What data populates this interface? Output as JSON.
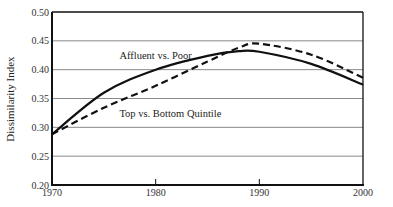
{
  "chart_data": {
    "type": "line",
    "title": "",
    "xlabel": "",
    "ylabel": "Dissimilarity Index",
    "xlim": [
      1970,
      2000
    ],
    "ylim": [
      0.2,
      0.5
    ],
    "x_ticks": [
      "1970",
      "1980",
      "1990",
      "2000"
    ],
    "y_ticks": [
      "0.20",
      "0.25",
      "0.30",
      "0.35",
      "0.40",
      "0.45",
      "0.50"
    ],
    "grid": "horizontal",
    "legend": "inline annotations",
    "x": [
      1970,
      1975,
      1980,
      1985,
      1988,
      1990,
      1995,
      2000
    ],
    "series": [
      {
        "name": "Affluent vs. Poor",
        "style": "solid",
        "values": [
          0.288,
          0.36,
          0.4,
          0.424,
          0.432,
          0.431,
          0.41,
          0.374
        ]
      },
      {
        "name": "Top vs. Bottom Quintile",
        "style": "dashed",
        "values": [
          0.288,
          0.334,
          0.372,
          0.414,
          0.438,
          0.445,
          0.426,
          0.386
        ]
      }
    ],
    "annotations": [
      {
        "text": "Affluent vs. Poor",
        "x": 1976.5,
        "y": 0.425
      },
      {
        "text": "Top vs. Bottom Quintile",
        "x": 1976.5,
        "y": 0.325
      }
    ]
  },
  "colors": {
    "line": "#111111",
    "grid": "#8a8a8a",
    "axis": "#111111"
  }
}
